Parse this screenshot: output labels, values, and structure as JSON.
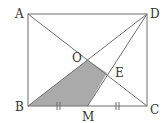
{
  "diagram": {
    "type": "geometry",
    "shape": "rectangle ABCD with diagonals AC and BD meeting at O; M is midpoint of BC; DM meets AC at E; quadrilateral OBME shaded",
    "colors": {
      "stroke": "#6e6e6e",
      "shade": "#aaaaaa",
      "label": "#333333",
      "background": "#ffffff"
    },
    "points": {
      "A": {
        "label": "A",
        "x": 28,
        "y": 14
      },
      "B": {
        "label": "B",
        "x": 28,
        "y": 106
      },
      "C": {
        "label": "C",
        "x": 147,
        "y": 106
      },
      "D": {
        "label": "D",
        "x": 147,
        "y": 14
      },
      "O": {
        "label": "O",
        "x": 87.5,
        "y": 60
      },
      "E": {
        "label": "E",
        "x": 107,
        "y": 73
      },
      "M": {
        "label": "M",
        "x": 87.5,
        "y": 106
      }
    },
    "segments": [
      "AB",
      "BC",
      "CD",
      "DA",
      "AC",
      "BD",
      "DM"
    ],
    "shaded_region": [
      "B",
      "O",
      "E",
      "M"
    ],
    "equal_marks": {
      "segments": [
        "BM",
        "MC"
      ],
      "mark": "‖"
    }
  }
}
